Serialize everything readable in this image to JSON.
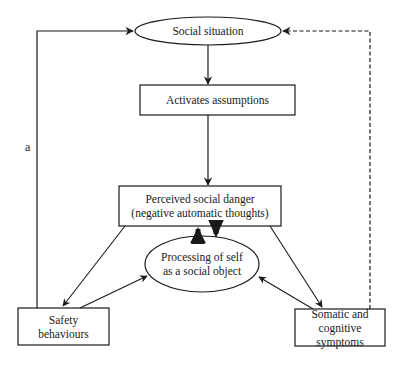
{
  "diagram": {
    "type": "flowchart",
    "nodes": {
      "social_situation": {
        "label": "Social situation",
        "shape": "ellipse"
      },
      "activates_assumptions": {
        "label": "Activates assumptions",
        "shape": "rectangle"
      },
      "perceived_danger": {
        "line1": "Perceived social danger",
        "line2": "(negative automatic thoughts)",
        "shape": "rectangle"
      },
      "processing_self": {
        "line1": "Processing of self",
        "line2": "as a social object",
        "shape": "ellipse"
      },
      "safety_behaviours": {
        "line1": "Safety",
        "line2": "behaviours",
        "shape": "rectangle"
      },
      "somatic_symptoms": {
        "line1": "Somatic and",
        "line2": "cognitive symptoms",
        "shape": "rectangle"
      }
    },
    "edge_labels": {
      "loop_a": "a"
    },
    "edges": [
      {
        "from": "social_situation",
        "to": "activates_assumptions",
        "style": "solid"
      },
      {
        "from": "activates_assumptions",
        "to": "perceived_danger",
        "style": "solid"
      },
      {
        "from": "perceived_danger",
        "to": "processing_self",
        "style": "bold"
      },
      {
        "from": "processing_self",
        "to": "perceived_danger",
        "style": "bold"
      },
      {
        "from": "perceived_danger",
        "to": "safety_behaviours",
        "style": "solid"
      },
      {
        "from": "perceived_danger",
        "to": "somatic_symptoms",
        "style": "solid"
      },
      {
        "from": "safety_behaviours",
        "to": "processing_self",
        "style": "solid"
      },
      {
        "from": "somatic_symptoms",
        "to": "processing_self",
        "style": "solid"
      },
      {
        "from": "safety_behaviours",
        "to": "social_situation",
        "style": "solid",
        "label": "a"
      },
      {
        "from": "somatic_symptoms",
        "to": "social_situation",
        "style": "dashed"
      }
    ]
  }
}
